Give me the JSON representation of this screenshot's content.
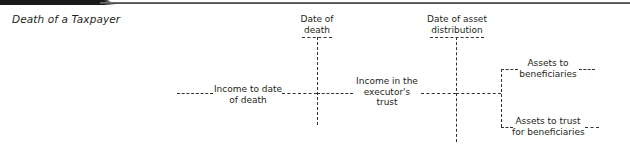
{
  "header": {
    "exhibit_tab_color": "#1a1a1a"
  },
  "title": "Death of a Taxpayer",
  "diagram": {
    "milestones": [
      {
        "label_line1": "Date of",
        "label_line2": "death"
      },
      {
        "label_line1": "Date of asset",
        "label_line2": "distribution"
      }
    ],
    "phases": [
      {
        "label_line1": "Income to date",
        "label_line2": "of death"
      },
      {
        "label_line1": "Income in the",
        "label_line2": "executor's",
        "label_line3": "trust"
      }
    ],
    "outcomes": [
      {
        "label_line1": "Assets to",
        "label_line2": "beneficiaries"
      },
      {
        "label_line1": "Assets to trust",
        "label_line2": "for beneficiaries"
      }
    ],
    "line_color": "#333333"
  }
}
